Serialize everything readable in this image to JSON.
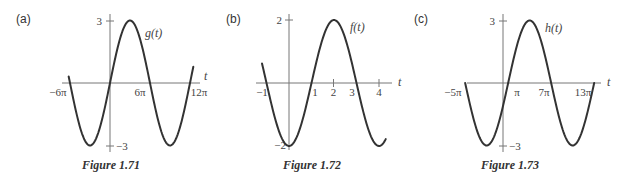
{
  "chart_data": [
    {
      "type": "line",
      "panel": "(a)",
      "caption": "Figure 1.71",
      "function_label": "g(t)",
      "xlabel": "t",
      "ylabel": "",
      "x_tick_labels": [
        "−6π",
        "6π",
        "12π"
      ],
      "x_tick_values_pi": [
        -6,
        6,
        12
      ],
      "y_tick_labels": [
        "3",
        "−3"
      ],
      "y_tick_values": [
        3,
        -3
      ],
      "ylim": [
        -3,
        3
      ],
      "xlim_pi": [
        -6.2,
        12.5
      ],
      "grid": false,
      "formula": "g(t) = 3 sin(t/6)",
      "amplitude": 3,
      "period_pi": 12,
      "phase_shift_pi": 0,
      "shape": "sin",
      "key_points": [
        {
          "t": "0",
          "value": 0
        },
        {
          "t": "3π",
          "value": 3
        },
        {
          "t": "6π",
          "value": 0
        },
        {
          "t": "9π",
          "value": -3
        },
        {
          "t": "12π",
          "value": 0
        },
        {
          "t": "−3π",
          "value": -3
        },
        {
          "t": "−6π",
          "value": 0
        }
      ]
    },
    {
      "type": "line",
      "panel": "(b)",
      "caption": "Figure 1.72",
      "function_label": "f(t)",
      "xlabel": "t",
      "ylabel": "",
      "x_tick_labels": [
        "−1",
        "1",
        "2",
        "3",
        "4"
      ],
      "x_tick_values": [
        -1,
        1,
        2,
        3,
        4
      ],
      "y_tick_labels": [
        "2",
        "−2"
      ],
      "y_tick_values": [
        2,
        -2
      ],
      "ylim": [
        -2,
        2
      ],
      "xlim": [
        -1.2,
        4.3
      ],
      "grid": false,
      "formula": "f(t) = −2 cos(πt/2)",
      "amplitude": 2,
      "period": 4,
      "shape": "neg-cos",
      "key_points": [
        {
          "t": "−1",
          "value": 0
        },
        {
          "t": "0",
          "value": -2
        },
        {
          "t": "1",
          "value": 0
        },
        {
          "t": "2",
          "value": 2
        },
        {
          "t": "3",
          "value": 0
        },
        {
          "t": "4",
          "value": -2
        }
      ]
    },
    {
      "type": "line",
      "panel": "(c)",
      "caption": "Figure 1.73",
      "function_label": "h(t)",
      "xlabel": "t",
      "ylabel": "",
      "x_tick_labels": [
        "−5π",
        "π",
        "7π",
        "13π"
      ],
      "x_tick_values_pi": [
        -5,
        1,
        7,
        13
      ],
      "y_tick_labels": [
        "3",
        "−3"
      ],
      "y_tick_values": [
        3,
        -3
      ],
      "ylim": [
        -3,
        3
      ],
      "xlim_pi": [
        -5,
        13
      ],
      "grid": false,
      "formula": "h(t) = 3 sin((t − π)/6)",
      "amplitude": 3,
      "period_pi": 12,
      "phase_shift_pi": 1,
      "shape": "sin",
      "key_points": [
        {
          "t": "−5π",
          "value": 0
        },
        {
          "t": "−2π",
          "value": -3
        },
        {
          "t": "π",
          "value": 0
        },
        {
          "t": "4π",
          "value": 3
        },
        {
          "t": "7π",
          "value": 0
        },
        {
          "t": "10π",
          "value": -3
        },
        {
          "t": "13π",
          "value": 0
        }
      ]
    }
  ],
  "panels": [
    {
      "label": "(a)",
      "caption": "Figure 1.71",
      "func": "g(t)",
      "axis_var": "t",
      "y_top": "3",
      "y_bottom": "−3",
      "x_labels": [
        "−6π",
        "6π",
        "12π"
      ]
    },
    {
      "label": "(b)",
      "caption": "Figure 1.72",
      "func": "f(t)",
      "axis_var": "t",
      "y_top": "2",
      "y_bottom": "−2",
      "x_labels": [
        "−1",
        "1",
        "2",
        "3",
        "4"
      ]
    },
    {
      "label": "(c)",
      "caption": "Figure 1.73",
      "func": "h(t)",
      "axis_var": "t",
      "y_top": "3",
      "y_bottom": "−3",
      "x_labels": [
        "−5π",
        "π",
        "7π",
        "13π"
      ]
    }
  ],
  "colors": {
    "curve": "#333333",
    "axis": "#777777",
    "text": "#444444",
    "background": "#ffffff"
  }
}
